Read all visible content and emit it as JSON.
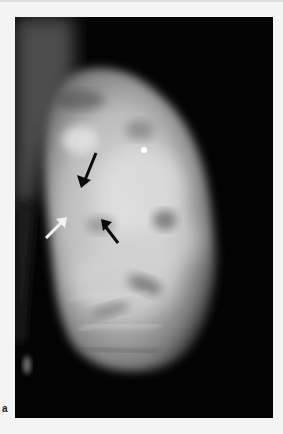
{
  "figure": {
    "panel_label": "a",
    "image_kind": "mammogram",
    "colors": {
      "page_background": "#f4f4f4",
      "image_background": "#030303",
      "tissue_light": "#d9d9d9",
      "tissue_mid": "#9a9a9a",
      "arrow_black": "#0a0a0a",
      "arrow_white": "#f2f2f2"
    },
    "annotations": [
      {
        "name": "black-arrow-upper",
        "color": "black",
        "tail": [
          96,
          153
        ],
        "tip": [
          81,
          188
        ]
      },
      {
        "name": "white-arrow",
        "color": "white",
        "tail": [
          46,
          238
        ],
        "tip": [
          67,
          217
        ]
      },
      {
        "name": "black-arrow-lower",
        "color": "black",
        "tail": [
          118,
          243
        ],
        "tip": [
          101,
          219
        ]
      },
      {
        "name": "bright-dot-marker",
        "color": "white",
        "center": [
          144,
          150
        ],
        "radius": 3
      }
    ]
  }
}
